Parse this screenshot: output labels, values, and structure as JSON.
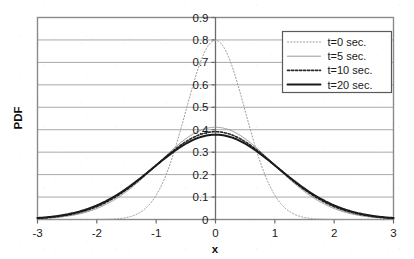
{
  "chart_data": {
    "type": "line",
    "title": "",
    "xlabel": "x",
    "ylabel": "PDF",
    "xlim": [
      -3,
      3
    ],
    "ylim": [
      0,
      0.9
    ],
    "xticks": [
      "-3",
      "-2",
      "-1",
      "0",
      "1",
      "2",
      "3"
    ],
    "xtick_values": [
      -3,
      -2,
      -1,
      0,
      1,
      2,
      3
    ],
    "yticks": [
      "0",
      "0.1",
      "0.2",
      "0.3",
      "0.4",
      "0.5",
      "0.6",
      "0.7",
      "0.8",
      "0.9"
    ],
    "ytick_values": [
      0,
      0.1,
      0.2,
      0.3,
      0.4,
      0.5,
      0.6,
      0.7,
      0.8,
      0.9
    ],
    "grid": "horizontal",
    "legend_position": "upper-right",
    "x": [
      -3.0,
      -2.9,
      -2.8,
      -2.7,
      -2.6,
      -2.5,
      -2.4,
      -2.3,
      -2.2,
      -2.1,
      -2.0,
      -1.9,
      -1.8,
      -1.7,
      -1.6,
      -1.5,
      -1.4,
      -1.3,
      -1.2,
      -1.1,
      -1.0,
      -0.9,
      -0.8,
      -0.7,
      -0.6,
      -0.5,
      -0.4,
      -0.3,
      -0.2,
      -0.1,
      0.0,
      0.1,
      0.2,
      0.3,
      0.4,
      0.5,
      0.6,
      0.7,
      0.8,
      0.9,
      1.0,
      1.1,
      1.2,
      1.3,
      1.4,
      1.5,
      1.6,
      1.7,
      1.8,
      1.9,
      2.0,
      2.1,
      2.2,
      2.3,
      2.4,
      2.5,
      2.6,
      2.7,
      2.8,
      2.9,
      3.0
    ],
    "series": [
      {
        "name": "t=0 sec.",
        "sigma": 0.5,
        "peak": 0.798,
        "style": "dotted",
        "width": 1.0,
        "color": "#9a9a9a",
        "values": [
          0.0,
          0.0,
          0.0,
          0.0,
          0.0,
          0.0001,
          0.0002,
          0.0005,
          0.0011,
          0.0024,
          0.0053,
          0.0111,
          0.0222,
          0.0422,
          0.0761,
          0.1296,
          0.209,
          0.3188,
          0.4602,
          0.6283,
          0.8118,
          0.9933,
          1.152,
          1.2666,
          1.3188,
          1.2952,
          1.2098,
          1.0684,
          0.8934,
          0.7077,
          0.7979,
          0.794,
          0.7821,
          0.7624,
          0.7365,
          0.7041,
          0.6664,
          0.6248,
          0.5793,
          0.5323,
          0.4839,
          0.4361,
          0.3894,
          0.3447,
          0.3027,
          0.2636,
          0.2279,
          0.1954,
          0.1662,
          0.1403,
          0.1175,
          0.0976,
          0.0804,
          0.0656,
          0.0532,
          0.0427,
          0.034,
          0.0268,
          0.021,
          0.0163,
          0.0126
        ]
      },
      {
        "name": "t=5 sec.",
        "sigma": 0.97,
        "peak": 0.411,
        "style": "solid",
        "width": 0.9,
        "color": "#8c8c8c",
        "values": [
          0.0019,
          0.0026,
          0.0035,
          0.0046,
          0.0061,
          0.008,
          0.0104,
          0.0133,
          0.0169,
          0.0213,
          0.0265,
          0.0327,
          0.0399,
          0.0482,
          0.0576,
          0.068,
          0.0795,
          0.0918,
          0.1048,
          0.1183,
          0.132,
          0.1457,
          0.1589,
          0.1714,
          0.1829,
          0.1931,
          0.2016,
          0.2083,
          0.2131,
          0.2159,
          0.411,
          0.4088,
          0.4024,
          0.392,
          0.3779,
          0.3605,
          0.3403,
          0.3179,
          0.2939,
          0.2689,
          0.2435,
          0.2184,
          0.1939,
          0.1705,
          0.1485,
          0.1282,
          0.1098,
          0.0932,
          0.0785,
          0.0656,
          0.0544,
          0.0447,
          0.0365,
          0.0295,
          0.0237,
          0.0189,
          0.0149,
          0.0117,
          0.0091,
          0.007,
          0.0054
        ]
      },
      {
        "name": "t=10 sec.",
        "sigma": 1.02,
        "peak": 0.391,
        "style": "dotted",
        "width": 1.6,
        "color": "#2b2b2b",
        "values": [
          0.003,
          0.004,
          0.0052,
          0.0068,
          0.0087,
          0.0111,
          0.0141,
          0.0177,
          0.022,
          0.0272,
          0.0332,
          0.0402,
          0.0482,
          0.0573,
          0.0674,
          0.0784,
          0.0903,
          0.1029,
          0.116,
          0.1294,
          0.1428,
          0.156,
          0.1685,
          0.1802,
          0.1906,
          0.1996,
          0.2069,
          0.2124,
          0.2159,
          0.2176,
          0.3911,
          0.3892,
          0.3836,
          0.3744,
          0.3618,
          0.3462,
          0.328,
          0.3076,
          0.2856,
          0.2625,
          0.2389,
          0.2152,
          0.192,
          0.1696,
          0.1484,
          0.1286,
          0.1105,
          0.0942,
          0.0796,
          0.0668,
          0.0556,
          0.0459,
          0.0376,
          0.0306,
          0.0247,
          0.0197,
          0.0156,
          0.0123,
          0.0096,
          0.0074,
          0.0057
        ]
      },
      {
        "name": "t=20 sec.",
        "sigma": 1.055,
        "peak": 0.378,
        "style": "solid",
        "width": 2.0,
        "color": "#1a1a1a",
        "values": [
          0.0041,
          0.0053,
          0.0068,
          0.0087,
          0.011,
          0.0138,
          0.0172,
          0.0212,
          0.0259,
          0.0315,
          0.0379,
          0.0452,
          0.0535,
          0.0627,
          0.0729,
          0.084,
          0.0958,
          0.1083,
          0.1212,
          0.1343,
          0.1473,
          0.16,
          0.172,
          0.1831,
          0.1929,
          0.2013,
          0.208,
          0.213,
          0.2161,
          0.2176,
          0.3781,
          0.3764,
          0.3713,
          0.363,
          0.3515,
          0.3372,
          0.3204,
          0.3016,
          0.2811,
          0.2595,
          0.2373,
          0.215,
          0.193,
          0.1717,
          0.1513,
          0.1323,
          0.1147,
          0.0987,
          0.0844,
          0.0716,
          0.0604,
          0.0506,
          0.0421,
          0.0348,
          0.0286,
          0.0233,
          0.0188,
          0.0151,
          0.012,
          0.0095,
          0.0074
        ]
      }
    ]
  },
  "legend": {
    "entries": [
      {
        "label": "t=0 sec."
      },
      {
        "label": "t=5 sec."
      },
      {
        "label": "t=10 sec."
      },
      {
        "label": "t=20 sec."
      }
    ]
  },
  "axes": {
    "y_title": "PDF",
    "x_title": "x"
  },
  "colors": {
    "plot_border": "#8a8a8a",
    "gridline": "#a8a8a8",
    "axis_line": "#6b6b6b",
    "text": "#1a1a1a",
    "background": "#ffffff",
    "legend_border": "#5a5a5a"
  }
}
